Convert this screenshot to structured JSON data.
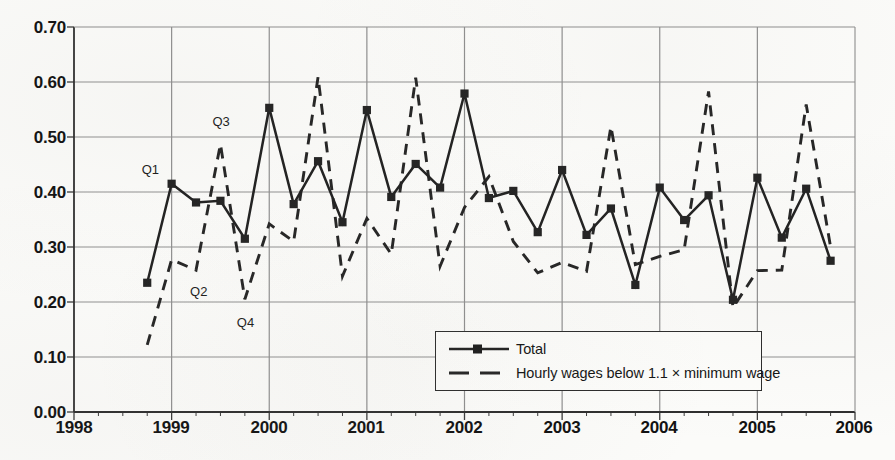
{
  "chart_data": {
    "type": "line",
    "title": "",
    "subtitle": "",
    "xlabel": "",
    "ylabel": "",
    "xlim": [
      1998.0,
      2006.0
    ],
    "ylim": [
      0.0,
      0.7
    ],
    "grid": true,
    "legend_position": "inside-bottom-center",
    "x_tick_labels": [
      "1998",
      "1999",
      "2000",
      "2001",
      "2002",
      "2003",
      "2004",
      "2005",
      "2006"
    ],
    "x_tick_values": [
      1998,
      1999,
      2000,
      2001,
      2002,
      2003,
      2004,
      2005,
      2006
    ],
    "y_tick_labels": [
      "0.00",
      "0.10",
      "0.20",
      "0.30",
      "0.40",
      "0.50",
      "0.60",
      "0.70"
    ],
    "y_tick_values": [
      0.0,
      0.1,
      0.2,
      0.3,
      0.4,
      0.5,
      0.6,
      0.7
    ],
    "x_minor_ticks_per_interval": 4,
    "x": [
      1998.75,
      1999.0,
      1999.25,
      1999.5,
      1999.75,
      2000.0,
      2000.25,
      2000.5,
      2000.75,
      2001.0,
      2001.25,
      2001.5,
      2001.75,
      2002.0,
      2002.25,
      2002.5,
      2002.75,
      2003.0,
      2003.25,
      2003.5,
      2003.75,
      2004.0,
      2004.25,
      2004.5,
      2004.75,
      2005.0,
      2005.25,
      2005.5,
      2005.75
    ],
    "series": [
      {
        "name": "Total",
        "style": "solid",
        "marker": "square",
        "color": "#222222",
        "values": [
          0.235,
          0.415,
          0.381,
          0.384,
          0.315,
          0.553,
          0.378,
          0.456,
          0.345,
          0.549,
          0.391,
          0.451,
          0.408,
          0.579,
          0.389,
          0.402,
          0.327,
          0.44,
          0.322,
          0.37,
          0.231,
          0.408,
          0.349,
          0.394,
          0.204,
          0.426,
          0.317,
          0.406,
          0.275
        ]
      },
      {
        "name": "Hourly wages below 1.1 × minimum wage",
        "style": "dashed",
        "marker": "none",
        "color": "#222222",
        "values": [
          0.122,
          0.277,
          0.258,
          0.487,
          0.205,
          0.342,
          0.31,
          0.609,
          0.247,
          0.352,
          0.287,
          0.608,
          0.265,
          0.372,
          0.428,
          0.31,
          0.253,
          0.272,
          0.256,
          0.519,
          0.268,
          0.283,
          0.295,
          0.583,
          0.19,
          0.257,
          0.258,
          0.559,
          0.3
        ]
      }
    ],
    "annotations": [
      {
        "label": "Q1",
        "x": 1999.0,
        "y": 0.415
      },
      {
        "label": "Q2",
        "x": 1999.25,
        "y": 0.258
      },
      {
        "label": "Q3",
        "x": 1999.5,
        "y": 0.487
      },
      {
        "label": "Q4",
        "x": 1999.75,
        "y": 0.205
      }
    ]
  },
  "legend": {
    "items": [
      {
        "label": "Total",
        "style": "solid-marker"
      },
      {
        "label": "Hourly wages below 1.1 × minimum wage",
        "style": "dashed"
      }
    ]
  },
  "axes": {
    "y_labels": [
      "0.70",
      "0.60",
      "0.50",
      "0.40",
      "0.30",
      "0.20",
      "0.10",
      "0.00"
    ],
    "x_labels": [
      "1998",
      "1999",
      "2000",
      "2001",
      "2002",
      "2003",
      "2004",
      "2005",
      "2006"
    ]
  },
  "annotations": {
    "q1": "Q1",
    "q2": "Q2",
    "q3": "Q3",
    "q4": "Q4"
  }
}
